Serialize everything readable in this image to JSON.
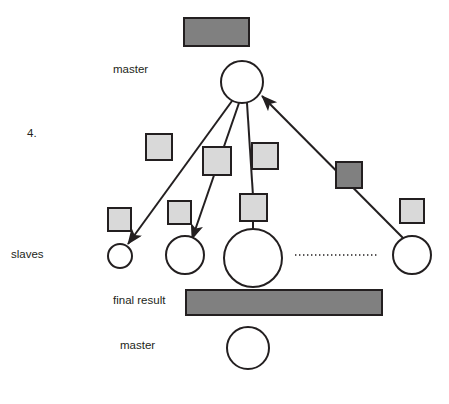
{
  "diagram": {
    "step_number": "4.",
    "labels": {
      "master_top": "master",
      "slaves": "slaves",
      "final_result": "final result",
      "master_bottom": "master"
    },
    "colors": {
      "dark_fill": "#808080",
      "light_fill": "#d9d9d9",
      "stroke": "#231f20",
      "circle_fill": "#ffffff",
      "text": "#231f20",
      "background": "#ffffff"
    },
    "shapes": {
      "top_task_bar": {
        "x": 184,
        "y": 18,
        "width": 65,
        "height": 28,
        "fill": "dark"
      },
      "master_circle_top": {
        "cx": 242,
        "cy": 82,
        "r": 21
      },
      "master_circle_bottom": {
        "cx": 248,
        "cy": 348,
        "r": 21
      },
      "final_result_bar": {
        "x": 186,
        "y": 290,
        "width": 196,
        "height": 25,
        "fill": "dark"
      },
      "slave_circles": [
        {
          "cx": 120,
          "cy": 256,
          "r": 12
        },
        {
          "cx": 185,
          "cy": 255,
          "r": 19
        },
        {
          "cx": 253,
          "cy": 258,
          "r": 29
        },
        {
          "cx": 412,
          "cy": 255,
          "r": 19
        }
      ],
      "task_squares": [
        {
          "x": 146,
          "y": 134,
          "size": 26,
          "fill": "light"
        },
        {
          "x": 203,
          "y": 147,
          "size": 28,
          "fill": "light"
        },
        {
          "x": 252,
          "y": 143,
          "size": 26,
          "fill": "light"
        },
        {
          "x": 336,
          "y": 162,
          "size": 26,
          "fill": "dark"
        },
        {
          "x": 108,
          "y": 208,
          "size": 23,
          "fill": "light"
        },
        {
          "x": 168,
          "y": 201,
          "size": 23,
          "fill": "light"
        },
        {
          "x": 240,
          "y": 194,
          "size": 27,
          "fill": "light"
        },
        {
          "x": 400,
          "y": 199,
          "size": 24,
          "fill": "light"
        }
      ],
      "dotted_separator": {
        "x1": 295,
        "y1": 255,
        "x2": 378,
        "y2": 255
      },
      "arrows_out": [
        {
          "x1": 232,
          "y1": 101,
          "x2": 127,
          "y2": 243,
          "arrowhead": true
        },
        {
          "x1": 239,
          "y1": 103,
          "x2": 192,
          "y2": 238,
          "arrowhead": true
        },
        {
          "x1": 247,
          "y1": 103,
          "x2": 253,
          "y2": 194,
          "arrowhead": false
        }
      ],
      "arrows_in": [
        {
          "x1": 404,
          "y1": 238,
          "x2": 261,
          "y2": 95,
          "arrowhead": true
        }
      ]
    }
  }
}
